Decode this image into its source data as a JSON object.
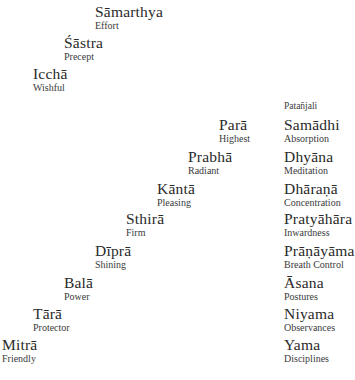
{
  "ladder_upper": [
    {
      "term": "Sāmarthya",
      "gloss": "Effort"
    },
    {
      "term": "Śāstra",
      "gloss": "Precept"
    },
    {
      "term": "Icchā",
      "gloss": "Wishful"
    }
  ],
  "ladder_lower": [
    {
      "term": "Parā",
      "gloss": "Highest"
    },
    {
      "term": "Prabhā",
      "gloss": "Radiant"
    },
    {
      "term": "Kāntā",
      "gloss": "Pleasing"
    },
    {
      "term": "Sthirā",
      "gloss": "Firm"
    },
    {
      "term": "Dīprā",
      "gloss": "Shining"
    },
    {
      "term": "Balā",
      "gloss": "Power"
    },
    {
      "term": "Tārā",
      "gloss": "Protector"
    },
    {
      "term": "Mitrā",
      "gloss": "Friendly"
    }
  ],
  "patanjali": {
    "heading": "Patañjali",
    "limbs": [
      {
        "term": "Samādhi",
        "gloss": "Absorption"
      },
      {
        "term": "Dhyāna",
        "gloss": "Meditation"
      },
      {
        "term": "Dhāraṇā",
        "gloss": "Concentration"
      },
      {
        "term": "Pratyāhāra",
        "gloss": "Inwardness"
      },
      {
        "term": "Prāṇāyāma",
        "gloss": "Breath Control"
      },
      {
        "term": "Āsana",
        "gloss": "Postures"
      },
      {
        "term": "Niyama",
        "gloss": "Observances"
      },
      {
        "term": "Yama",
        "gloss": "Disciplines"
      }
    ]
  }
}
